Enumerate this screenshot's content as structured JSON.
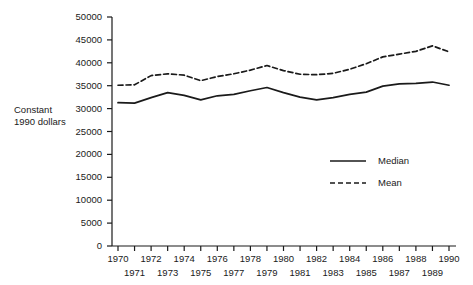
{
  "chart_data": {
    "type": "line",
    "title": "",
    "xlabel": "",
    "ylabel": "Constant\n1990 dollars",
    "ylabel_lines": [
      "Constant",
      "1990 dollars"
    ],
    "ylim": [
      0,
      50000
    ],
    "xlim": [
      1970,
      1990
    ],
    "grid": false,
    "legend_position": "center-right",
    "yticks": [
      0,
      5000,
      10000,
      15000,
      20000,
      25000,
      30000,
      35000,
      40000,
      45000,
      50000
    ],
    "ytick_labels": [
      "0",
      "5000",
      "10000",
      "15000",
      "20000",
      "25000",
      "30000",
      "35000",
      "40000",
      "45000",
      "50000"
    ],
    "x": [
      1970,
      1971,
      1972,
      1973,
      1974,
      1975,
      1976,
      1977,
      1978,
      1979,
      1980,
      1981,
      1982,
      1983,
      1984,
      1985,
      1986,
      1987,
      1988,
      1989,
      1990
    ],
    "xtick_labels": [
      "1970",
      "1971",
      "1972",
      "1973",
      "1974",
      "1975",
      "1976",
      "1977",
      "1978",
      "1979",
      "1980",
      "1981",
      "1982",
      "1983",
      "1984",
      "1985",
      "1986",
      "1987",
      "1988",
      "1989",
      "1990"
    ],
    "xtick_rows": [
      0,
      1,
      0,
      1,
      0,
      1,
      0,
      1,
      0,
      1,
      0,
      1,
      0,
      1,
      0,
      1,
      0,
      1,
      0,
      1,
      0
    ],
    "series": [
      {
        "name": "Median",
        "style": "solid",
        "color": "#1a1a1a",
        "values": [
          31300,
          31200,
          32400,
          33500,
          32900,
          31900,
          32800,
          33100,
          33900,
          34600,
          33500,
          32500,
          31900,
          32400,
          33100,
          33600,
          34900,
          35400,
          35500,
          35800,
          35100
        ]
      },
      {
        "name": "Mean",
        "style": "dashed",
        "color": "#1a1a1a",
        "values": [
          35100,
          35200,
          37200,
          37600,
          37300,
          36100,
          37000,
          37600,
          38400,
          39400,
          38300,
          37500,
          37400,
          37700,
          38600,
          39800,
          41300,
          41900,
          42500,
          43700,
          42400
        ]
      }
    ]
  },
  "legend": {
    "items": [
      {
        "label": "Median",
        "style": "solid"
      },
      {
        "label": "Mean",
        "style": "dashed"
      }
    ]
  }
}
